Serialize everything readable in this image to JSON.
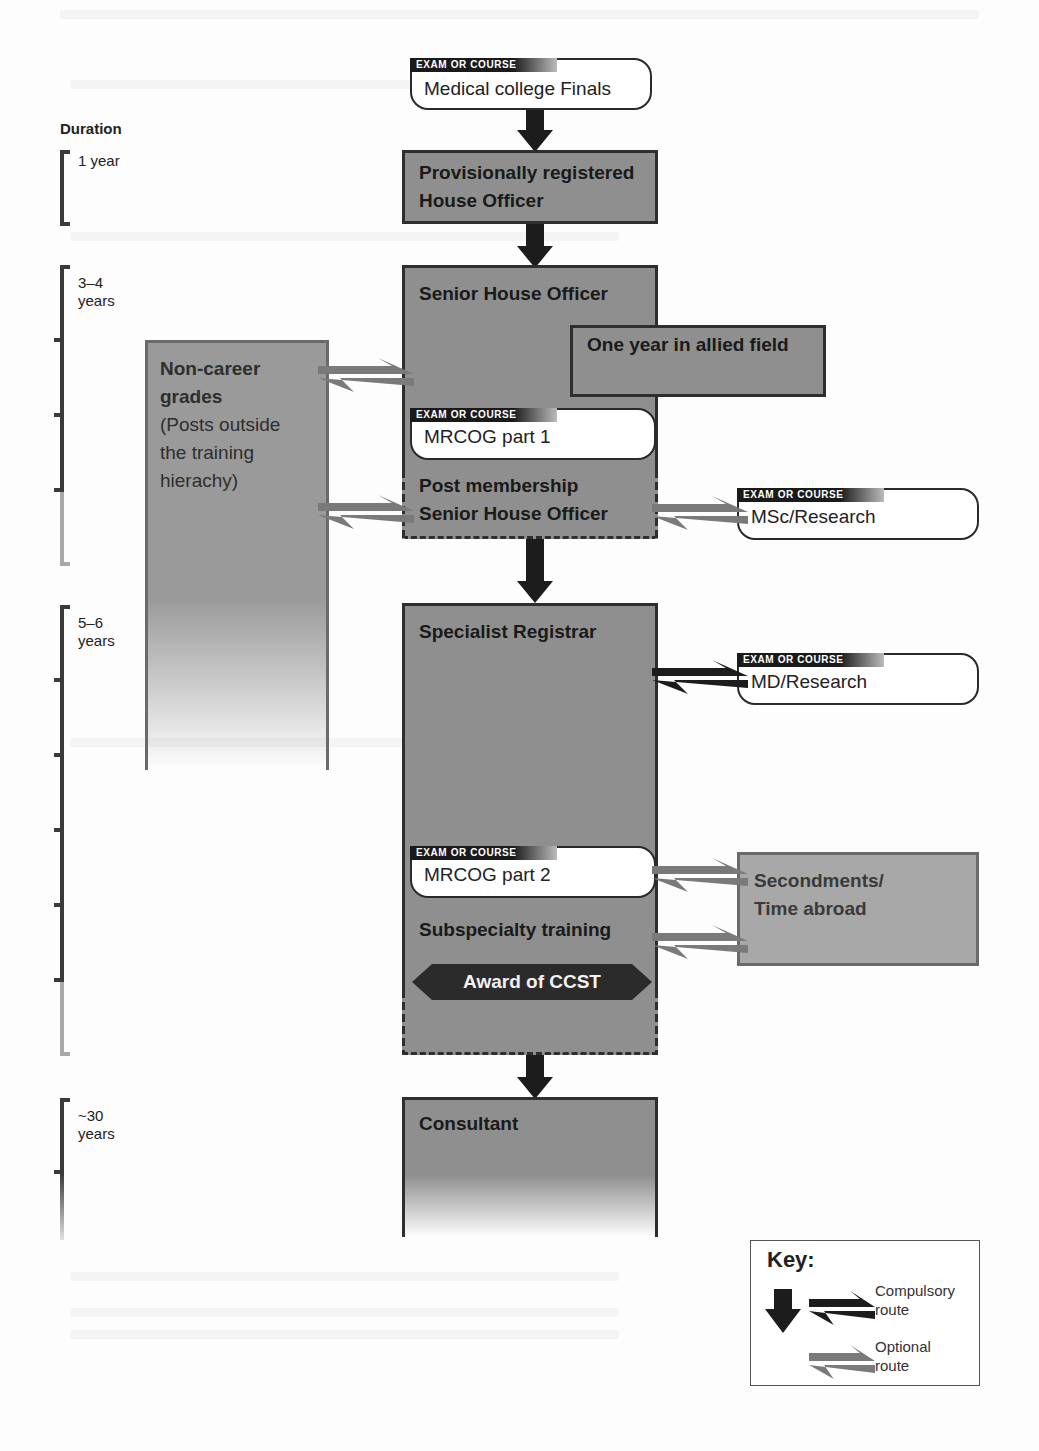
{
  "diagram": {
    "type": "career-pathway-flowchart",
    "duration_scale": {
      "title": "Duration",
      "periods": [
        {
          "label": "1 year",
          "top": 150,
          "bottom": 226,
          "ticks": []
        },
        {
          "label": "3–4 years",
          "top": 265,
          "bottom": 566,
          "ticks": [
            340,
            415,
            490
          ],
          "light_from": 490
        },
        {
          "label": "5–6 years",
          "top": 605,
          "bottom": 1056,
          "ticks": [
            680,
            755,
            830,
            905,
            980
          ],
          "light_from": 980
        },
        {
          "label": "~30 years",
          "top": 1098,
          "bottom": 1240,
          "ticks": [
            1172
          ],
          "light_from": 1172,
          "fades": true
        }
      ]
    },
    "exam_label": "EXAM OR COURSE",
    "nodes": {
      "finals": {
        "type": "exam",
        "tag": "EXAM OR COURSE",
        "label": "Medical college Finals"
      },
      "house_officer": {
        "type": "stage",
        "label_line1": "Provisionally registered",
        "label_line2": "House Officer"
      },
      "sho": {
        "type": "stage",
        "label": "Senior House Officer"
      },
      "allied_field": {
        "type": "optional-stage",
        "label": "One year in allied field"
      },
      "mrcog1": {
        "type": "exam",
        "tag": "EXAM OR COURSE",
        "label": "MRCOG part 1"
      },
      "post_membership": {
        "type": "stage",
        "label_line1": "Post membership",
        "label_line2": "Senior House Officer"
      },
      "msc": {
        "type": "exam",
        "tag": "EXAM OR COURSE",
        "label": "MSc/Research"
      },
      "non_career": {
        "type": "optional-stage",
        "label_line1": "Non-career",
        "label_line2": "grades",
        "note_line1": "(Posts outside",
        "note_line2": "the training",
        "note_line3": "hierachy)"
      },
      "spr": {
        "type": "stage",
        "label": "Specialist Registrar"
      },
      "md": {
        "type": "exam",
        "tag": "EXAM OR COURSE",
        "label": "MD/Research"
      },
      "mrcog2": {
        "type": "exam",
        "tag": "EXAM OR COURSE",
        "label": "MRCOG part 2"
      },
      "subspecialty": {
        "type": "stage",
        "label": "Subspecialty training"
      },
      "ccst": {
        "type": "milestone",
        "label": "Award of CCST"
      },
      "secondments": {
        "type": "optional-stage",
        "label_line1": "Secondments/",
        "label_line2": "Time abroad"
      },
      "consultant": {
        "type": "stage",
        "label": "Consultant"
      }
    },
    "edges": [
      {
        "from": "finals",
        "to": "house_officer",
        "kind": "compulsory",
        "direction": "down"
      },
      {
        "from": "house_officer",
        "to": "sho",
        "kind": "compulsory",
        "direction": "down"
      },
      {
        "from": "sho",
        "to": "non_career",
        "kind": "optional",
        "direction": "two-way"
      },
      {
        "from": "post_membership",
        "to": "non_career",
        "kind": "optional",
        "direction": "two-way"
      },
      {
        "from": "post_membership",
        "to": "msc",
        "kind": "optional",
        "direction": "two-way"
      },
      {
        "from": "post_membership",
        "to": "spr",
        "kind": "compulsory",
        "direction": "down"
      },
      {
        "from": "spr",
        "to": "md",
        "kind": "compulsory",
        "direction": "two-way"
      },
      {
        "from": "mrcog2",
        "to": "secondments",
        "kind": "optional",
        "direction": "two-way"
      },
      {
        "from": "subspecialty",
        "to": "secondments",
        "kind": "optional",
        "direction": "two-way"
      },
      {
        "from": "ccst",
        "to": "consultant",
        "kind": "compulsory",
        "direction": "down"
      }
    ],
    "key": {
      "title": "Key:",
      "compulsory_line1": "Compulsory",
      "compulsory_line2": "route",
      "optional_line1": "Optional",
      "optional_line2": "route"
    },
    "colors": {
      "stage_fill": "#8f8f8f",
      "optional_fill": "#a8a8a8",
      "border_dark": "#2e2e2e",
      "compulsory_arrow": "#1c1c1c",
      "optional_arrow": "#7a7a7a",
      "ccst_fill": "#2b2b2b"
    }
  }
}
